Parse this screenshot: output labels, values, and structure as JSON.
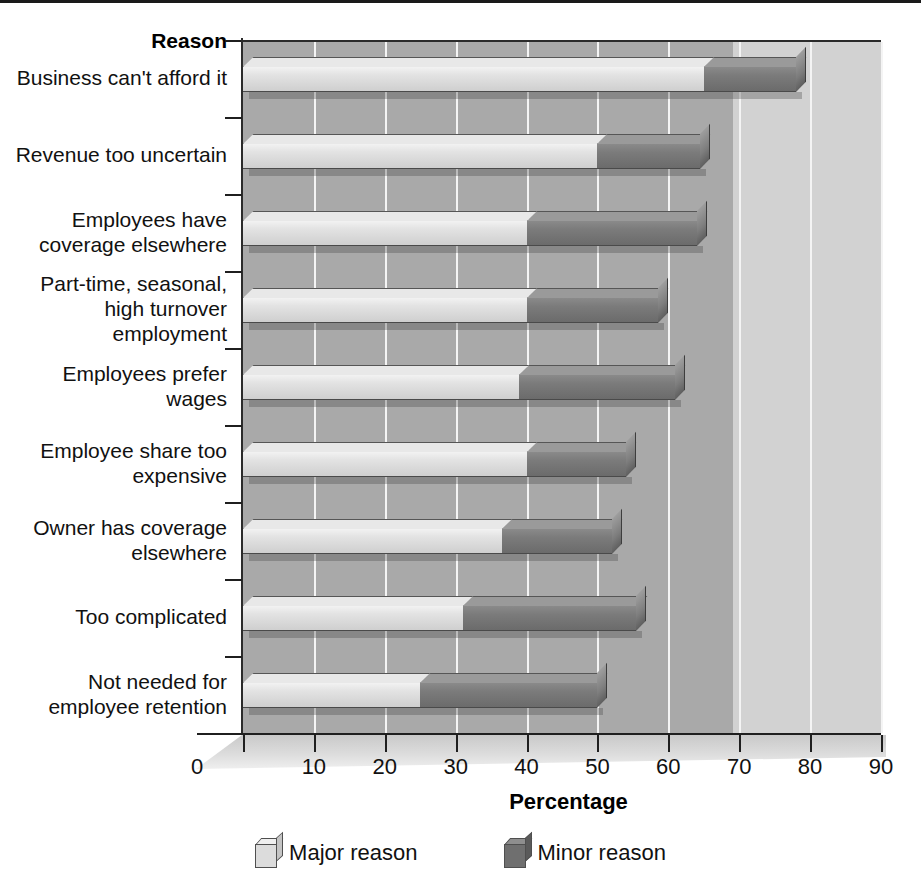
{
  "chart_data": {
    "type": "bar",
    "orientation": "horizontal",
    "stacked": true,
    "title": "",
    "xlabel": "Percentage",
    "ylabel": "Reason",
    "xlim": [
      0,
      90
    ],
    "xticks": [
      0,
      10,
      20,
      30,
      40,
      50,
      60,
      70,
      80,
      90
    ],
    "grid": "vertical",
    "legend_position": "bottom",
    "categories": [
      "Business can't afford it",
      "Revenue too uncertain",
      "Employees have\ncoverage elsewhere",
      "Part-time, seasonal,\nhigh turnover\nemployment",
      "Employees prefer\nwages",
      "Employee share too\nexpensive",
      "Owner has coverage\nelsewhere",
      "Too complicated",
      "Not needed for\nemployee retention"
    ],
    "series": [
      {
        "name": "Major reason",
        "color": "#dcdcdc",
        "values": [
          65,
          50,
          40,
          40,
          39,
          40,
          36.5,
          31,
          25
        ]
      },
      {
        "name": "Minor reason",
        "color": "#6f6f6f",
        "values": [
          13,
          14.5,
          24,
          18.5,
          22,
          14,
          15.5,
          24.5,
          25
        ]
      }
    ],
    "totals": [
      78,
      64.5,
      64,
      58.5,
      61,
      54,
      52,
      55.5,
      50
    ]
  },
  "axes": {
    "y_title": "Reason",
    "x_title": "Percentage",
    "x_tick_labels": [
      "0",
      "10",
      "20",
      "30",
      "40",
      "50",
      "60",
      "70",
      "80",
      "90"
    ]
  },
  "legend": {
    "items": [
      {
        "label": "Major reason",
        "swatch": "major-reason-swatch"
      },
      {
        "label": "Minor reason",
        "swatch": "minor-reason-swatch"
      }
    ]
  },
  "colors": {
    "panel": "#a9a9a9",
    "panel_light_band": "#d2d2d2",
    "gridline": "#f4f4f4",
    "axis": "#1f1f1f",
    "major": "#dcdcdc",
    "minor": "#6f6f6f",
    "text": "#111111"
  }
}
